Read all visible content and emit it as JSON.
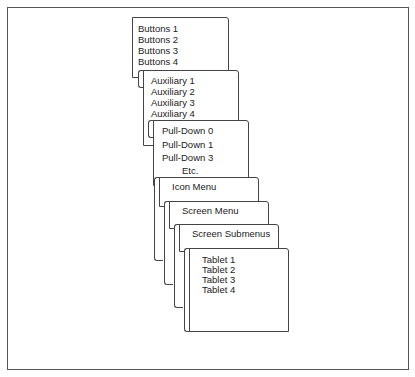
{
  "diagram": {
    "title": "",
    "cards": [
      {
        "id": "buttons",
        "items": [
          "Buttons 1",
          "Buttons 2",
          "Buttons 3",
          "Buttons 4"
        ]
      },
      {
        "id": "auxiliary",
        "items": [
          "Auxiliary 1",
          "Auxiliary 2",
          "Auxiliary 3",
          "Auxiliary 4"
        ]
      },
      {
        "id": "pulldown",
        "items": [
          "Pull-Down 0",
          "Pull-Down 1",
          "Pull-Down 3",
          "Etc."
        ]
      },
      {
        "id": "icon-menu",
        "items": [
          "Icon Menu"
        ]
      },
      {
        "id": "screen-menu",
        "items": [
          "Screen Menu"
        ]
      },
      {
        "id": "screen-submenus",
        "items": [
          "Screen Submenus"
        ]
      },
      {
        "id": "tablet",
        "items": [
          "Tablet 1",
          "Tablet 2",
          "Tablet 3",
          "Tablet 4"
        ]
      }
    ]
  }
}
